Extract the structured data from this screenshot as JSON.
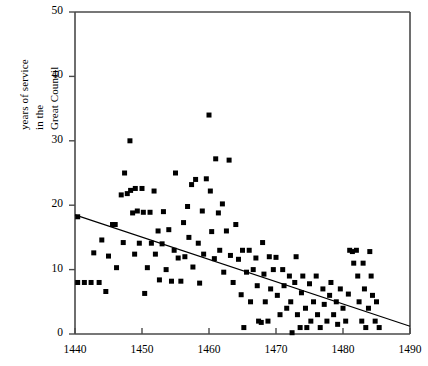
{
  "chart_data": {
    "type": "scatter",
    "title": "",
    "xlabel": "",
    "ylabel": "years of service in the Great Council",
    "ylabel_lines": [
      "years of service",
      "in the",
      "Great Council"
    ],
    "xlim": [
      1440,
      1490
    ],
    "ylim": [
      0,
      50
    ],
    "xticks": [
      1440,
      1450,
      1460,
      1470,
      1480,
      1490
    ],
    "xticklabels": [
      "1440",
      "1450",
      "1460",
      "1470",
      "1480",
      "1490"
    ],
    "yticks": [
      0,
      10,
      20,
      30,
      40,
      50
    ],
    "yticklabels": [
      "0",
      "10",
      "20",
      "30",
      "40",
      "50"
    ],
    "grid": false,
    "legend": null,
    "marker": "square",
    "marker_color": "#000000",
    "marker_size_px": 5,
    "frame_color": "#4a4a4a",
    "points": [
      [
        1440.4,
        18.2
      ],
      [
        1440.4,
        8.0
      ],
      [
        1441.4,
        8.0
      ],
      [
        1442.4,
        8.0
      ],
      [
        1442.8,
        12.6
      ],
      [
        1443.6,
        8.0
      ],
      [
        1444.0,
        14.6
      ],
      [
        1444.6,
        6.6
      ],
      [
        1445.0,
        12.1
      ],
      [
        1445.6,
        17.0
      ],
      [
        1446.0,
        17.0
      ],
      [
        1446.2,
        10.3
      ],
      [
        1446.9,
        21.6
      ],
      [
        1447.2,
        14.2
      ],
      [
        1447.4,
        25.0
      ],
      [
        1447.8,
        21.8
      ],
      [
        1448.2,
        30.0
      ],
      [
        1448.3,
        22.3
      ],
      [
        1448.6,
        18.8
      ],
      [
        1448.9,
        12.4
      ],
      [
        1449.0,
        22.6
      ],
      [
        1449.3,
        19.1
      ],
      [
        1449.6,
        14.1
      ],
      [
        1450.0,
        22.6
      ],
      [
        1450.2,
        18.9
      ],
      [
        1450.4,
        6.3
      ],
      [
        1450.8,
        10.3
      ],
      [
        1451.2,
        18.9
      ],
      [
        1451.4,
        14.1
      ],
      [
        1451.8,
        22.2
      ],
      [
        1452.0,
        12.4
      ],
      [
        1452.4,
        16.0
      ],
      [
        1452.6,
        8.4
      ],
      [
        1453.0,
        14.0
      ],
      [
        1453.2,
        19.0
      ],
      [
        1453.6,
        10.0
      ],
      [
        1454.0,
        16.2
      ],
      [
        1454.4,
        8.2
      ],
      [
        1454.8,
        13.0
      ],
      [
        1455.0,
        25.0
      ],
      [
        1455.4,
        11.8
      ],
      [
        1455.8,
        8.2
      ],
      [
        1456.2,
        17.3
      ],
      [
        1456.4,
        12.0
      ],
      [
        1456.8,
        19.8
      ],
      [
        1457.0,
        15.0
      ],
      [
        1457.4,
        23.2
      ],
      [
        1457.6,
        10.4
      ],
      [
        1458.0,
        24.0
      ],
      [
        1458.4,
        14.1
      ],
      [
        1458.6,
        7.9
      ],
      [
        1459.0,
        19.1
      ],
      [
        1459.2,
        12.4
      ],
      [
        1459.6,
        24.1
      ],
      [
        1460.0,
        34.0
      ],
      [
        1460.2,
        22.2
      ],
      [
        1460.4,
        15.9
      ],
      [
        1460.8,
        11.7
      ],
      [
        1461.0,
        27.2
      ],
      [
        1461.4,
        18.8
      ],
      [
        1461.6,
        13.0
      ],
      [
        1462.0,
        20.2
      ],
      [
        1462.2,
        9.6
      ],
      [
        1462.6,
        16.0
      ],
      [
        1463.0,
        27.0
      ],
      [
        1463.2,
        12.2
      ],
      [
        1463.6,
        8.0
      ],
      [
        1464.0,
        17.0
      ],
      [
        1464.4,
        11.6
      ],
      [
        1464.8,
        6.1
      ],
      [
        1465.0,
        13.0
      ],
      [
        1465.2,
        1.0
      ],
      [
        1465.6,
        9.6
      ],
      [
        1466.0,
        13.0
      ],
      [
        1466.2,
        5.0
      ],
      [
        1466.6,
        10.0
      ],
      [
        1467.0,
        11.8
      ],
      [
        1467.2,
        7.5
      ],
      [
        1467.4,
        2.0
      ],
      [
        1467.8,
        1.8
      ],
      [
        1468.0,
        14.2
      ],
      [
        1468.2,
        9.3
      ],
      [
        1468.4,
        5.0
      ],
      [
        1468.8,
        2.0
      ],
      [
        1469.0,
        12.0
      ],
      [
        1469.2,
        7.0
      ],
      [
        1469.6,
        10.0
      ],
      [
        1470.0,
        11.9
      ],
      [
        1470.2,
        6.0
      ],
      [
        1470.6,
        3.0
      ],
      [
        1471.0,
        10.0
      ],
      [
        1471.2,
        7.5
      ],
      [
        1471.6,
        4.0
      ],
      [
        1472.0,
        9.0
      ],
      [
        1472.2,
        5.0
      ],
      [
        1472.4,
        0.2
      ],
      [
        1472.8,
        8.0
      ],
      [
        1473.0,
        12.0
      ],
      [
        1473.2,
        3.0
      ],
      [
        1473.6,
        1.0
      ],
      [
        1473.8,
        6.4
      ],
      [
        1474.0,
        9.0
      ],
      [
        1474.4,
        4.0
      ],
      [
        1474.6,
        1.0
      ],
      [
        1475.0,
        7.8
      ],
      [
        1475.2,
        2.0
      ],
      [
        1475.6,
        5.0
      ],
      [
        1476.0,
        9.0
      ],
      [
        1476.2,
        3.0
      ],
      [
        1476.6,
        1.0
      ],
      [
        1477.0,
        7.0
      ],
      [
        1477.2,
        4.6
      ],
      [
        1477.6,
        2.0
      ],
      [
        1478.0,
        6.0
      ],
      [
        1478.2,
        8.0
      ],
      [
        1478.6,
        3.0
      ],
      [
        1479.0,
        5.0
      ],
      [
        1479.2,
        1.5
      ],
      [
        1479.6,
        7.0
      ],
      [
        1480.0,
        4.0
      ],
      [
        1480.4,
        2.0
      ],
      [
        1480.8,
        6.2
      ],
      [
        1481.0,
        13.0
      ],
      [
        1481.4,
        12.8
      ],
      [
        1481.6,
        11.0
      ],
      [
        1482.0,
        13.0
      ],
      [
        1482.2,
        9.0
      ],
      [
        1482.4,
        5.0
      ],
      [
        1482.8,
        2.0
      ],
      [
        1483.0,
        11.0
      ],
      [
        1483.2,
        7.0
      ],
      [
        1483.4,
        1.0
      ],
      [
        1483.8,
        4.0
      ],
      [
        1484.0,
        12.8
      ],
      [
        1484.2,
        9.0
      ],
      [
        1484.4,
        6.0
      ],
      [
        1484.8,
        2.0
      ],
      [
        1485.0,
        5.0
      ],
      [
        1485.4,
        1.0
      ]
    ],
    "trendline": {
      "x": [
        1440,
        1490
      ],
      "y": [
        18.5,
        1.2
      ],
      "color": "#000000"
    }
  }
}
